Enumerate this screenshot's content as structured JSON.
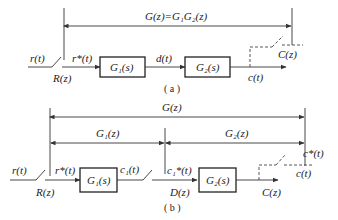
{
  "diagram_a": {
    "caption": "( a )",
    "overall_transfer": "G(z)=G₁G₂(z)",
    "input_signal": "r(t)",
    "input_z": "R(z)",
    "sampled_input": "r*(t)",
    "block1": "G₁(s)",
    "intermediate_signal": "d(t)",
    "block2": "G₂(s)",
    "output_signal": "c(t)",
    "output_z": "C(z)"
  },
  "diagram_b": {
    "caption": "( b )",
    "overall_transfer": "G(z)",
    "transfer1": "G₁(z)",
    "transfer2": "G₂(z)",
    "input_signal": "r(t)",
    "input_z": "R(z)",
    "sampled_input": "r*(t)",
    "block1": "G₁(s)",
    "intermediate_signal": "c₁(t)",
    "sampled_intermediate": "c₁*(t)",
    "intermediate_z": "D(z)",
    "block2": "G₂(s)",
    "output_signal": "c(t)",
    "sampled_output": "c*(t)",
    "output_z": "C(z)"
  },
  "colors": {
    "line": "#333333",
    "background": "#ffffff"
  }
}
